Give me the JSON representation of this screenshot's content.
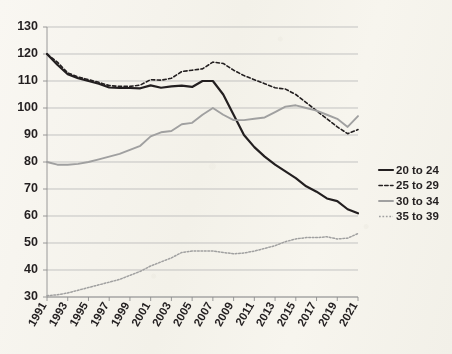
{
  "chart_data": {
    "type": "line",
    "title": "",
    "subtitle": "",
    "xlabel": "",
    "ylabel": "",
    "xlim": [
      1991,
      2021
    ],
    "ylim": [
      30,
      130
    ],
    "grid": "horizontal",
    "legend_position": "right",
    "y_ticks": [
      130,
      120,
      110,
      100,
      90,
      80,
      70,
      60,
      50,
      40,
      30
    ],
    "x_ticks": [
      1991,
      1993,
      1995,
      1997,
      1999,
      2001,
      2003,
      2005,
      2007,
      2009,
      2011,
      2013,
      2015,
      2017,
      2019,
      2021
    ],
    "x": [
      1991,
      1992,
      1993,
      1994,
      1995,
      1996,
      1997,
      1998,
      1999,
      2000,
      2001,
      2002,
      2003,
      2004,
      2005,
      2006,
      2007,
      2008,
      2009,
      2010,
      2011,
      2012,
      2013,
      2014,
      2015,
      2016,
      2017,
      2018,
      2019,
      2020,
      2021
    ],
    "series": [
      {
        "name": "20 to 24",
        "style": "solid",
        "color": "#231f20",
        "width": 2.2,
        "values": [
          120.0,
          116.0,
          112.5,
          111.0,
          110.0,
          109.0,
          107.6,
          107.4,
          107.4,
          107.3,
          108.4,
          107.5,
          108.0,
          108.3,
          107.8,
          110.0,
          110.0,
          105.0,
          97.5,
          90.0,
          85.5,
          82.0,
          79.0,
          76.5,
          74.0,
          71.0,
          69.0,
          66.5,
          65.5,
          62.5,
          61.0
        ]
      },
      {
        "name": "25 to 29",
        "style": "dashed",
        "color": "#231f20",
        "width": 1.6,
        "values": [
          120.0,
          117.0,
          113.0,
          111.5,
          110.5,
          109.5,
          108.3,
          108.0,
          108.0,
          108.5,
          110.5,
          110.3,
          111.0,
          113.5,
          114.0,
          114.5,
          117.0,
          116.5,
          114.0,
          112.0,
          110.5,
          109.0,
          107.5,
          107.0,
          105.0,
          102.0,
          99.0,
          96.0,
          93.0,
          90.5,
          92.0
        ]
      },
      {
        "name": "30 to 34",
        "style": "solid",
        "color": "#a0a0a0",
        "width": 1.9,
        "values": [
          80.0,
          79.0,
          79.0,
          79.3,
          80.0,
          81.0,
          82.0,
          83.0,
          84.5,
          86.0,
          89.5,
          91.0,
          91.5,
          94.0,
          94.5,
          97.5,
          100.0,
          97.5,
          95.5,
          95.5,
          96.0,
          96.5,
          98.5,
          100.5,
          101.0,
          100.0,
          99.0,
          97.5,
          96.0,
          93.0,
          97.0
        ]
      },
      {
        "name": "35 to 39",
        "style": "dotted",
        "color": "#a0a0a0",
        "width": 1.5,
        "values": [
          30.5,
          30.8,
          31.5,
          32.5,
          33.5,
          34.5,
          35.5,
          36.5,
          38.0,
          39.5,
          41.5,
          43.0,
          44.5,
          46.5,
          47.0,
          47.0,
          47.0,
          46.5,
          46.0,
          46.3,
          47.0,
          48.0,
          49.0,
          50.5,
          51.5,
          52.0,
          52.0,
          52.3,
          51.5,
          51.8,
          53.5
        ]
      }
    ]
  },
  "legend": {
    "items": [
      {
        "label": "20 to 24"
      },
      {
        "label": "25 to 29"
      },
      {
        "label": "30 to 34"
      },
      {
        "label": "35 to 39"
      }
    ]
  }
}
